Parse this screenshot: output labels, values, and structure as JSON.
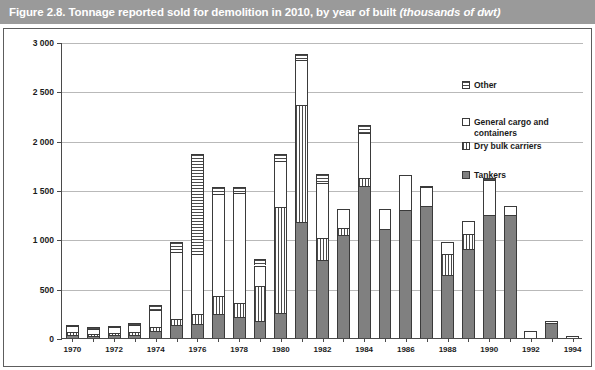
{
  "figure": {
    "title_main": "Figure 2.8.  Tonnage reported sold for demolition in 2010, by year of built ",
    "title_italic": "(thousands of dwt)"
  },
  "legend": {
    "position": "inside-top-right",
    "items": [
      {
        "label": "Other",
        "pattern": "horizontal-stripes",
        "key": "other"
      },
      {
        "label": "General cargo and\ncontainers",
        "pattern": "dots",
        "key": "general"
      },
      {
        "label": "Dry bulk carriers",
        "pattern": "vertical-stripes",
        "key": "drybulk"
      },
      {
        "label": "Tankers",
        "pattern": "solid-gray",
        "key": "tankers"
      }
    ]
  },
  "chart_data": {
    "type": "bar",
    "stacked": true,
    "title": "Figure 2.8.  Tonnage reported sold for demolition in 2010, by year of built (thousands of dwt)",
    "xlabel": "",
    "ylabel": "",
    "ylim": [
      0,
      3000
    ],
    "yticks": [
      0,
      500,
      1000,
      1500,
      2000,
      2500,
      3000
    ],
    "ytick_labels": [
      "0",
      "500",
      "1 000",
      "1 500",
      "2 000",
      "2 500",
      "3 000"
    ],
    "grid": "horizontal",
    "legend_position": "upper right",
    "categories": [
      "1970",
      "1971",
      "1972",
      "1973",
      "1974",
      "1975",
      "1976",
      "1977",
      "1978",
      "1979",
      "1980",
      "1981",
      "1982",
      "1983",
      "1984",
      "1985",
      "1986",
      "1987",
      "1988",
      "1989",
      "1990",
      "1991",
      "1992",
      "1993",
      "1994"
    ],
    "xtick_labels": [
      "1970",
      "1972",
      "1974",
      "1976",
      "1978",
      "1980",
      "1982",
      "1984",
      "1986",
      "1988",
      "1990",
      "1992",
      "1994"
    ],
    "series": [
      {
        "name": "Tankers",
        "pattern": "solid-gray",
        "color": "#808080",
        "values": [
          30,
          25,
          30,
          35,
          70,
          135,
          145,
          240,
          215,
          175,
          250,
          1180,
          790,
          1040,
          1545,
          1105,
          1300,
          1340,
          640,
          905,
          1245,
          1245,
          0,
          155,
          0
        ]
      },
      {
        "name": "Dry bulk carriers",
        "pattern": "vertical-stripes",
        "color": "#ffffff",
        "values": [
          35,
          20,
          25,
          30,
          45,
          55,
          95,
          185,
          140,
          355,
          1075,
          1180,
          220,
          70,
          75,
          0,
          0,
          0,
          215,
          150,
          0,
          0,
          0,
          0,
          0
        ]
      },
      {
        "name": "General cargo and containers",
        "pattern": "dots",
        "color": "#ffffff",
        "values": [
          55,
          50,
          55,
          65,
          165,
          680,
          615,
          1030,
          1110,
          205,
          465,
          460,
          560,
          195,
          455,
          200,
          355,
          190,
          120,
          130,
          355,
          95,
          70,
          15,
          20
        ]
      },
      {
        "name": "Other",
        "pattern": "horizontal-stripes",
        "color": "#ffffff",
        "values": [
          15,
          15,
          15,
          20,
          50,
          105,
          1015,
          75,
          70,
          65,
          80,
          60,
          95,
          0,
          85,
          0,
          0,
          10,
          0,
          0,
          25,
          0,
          0,
          0,
          0
        ]
      }
    ],
    "totals": [
      135,
      110,
      125,
      150,
      330,
      975,
      1870,
      1530,
      1535,
      800,
      1870,
      2880,
      1665,
      1305,
      2160,
      1305,
      1655,
      1540,
      975,
      1185,
      1625,
      1340,
      70,
      170,
      20
    ]
  }
}
